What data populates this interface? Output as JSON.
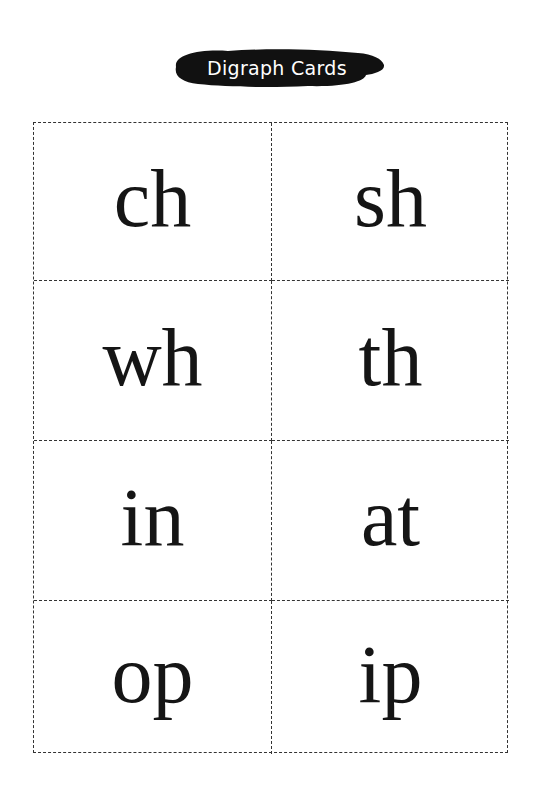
{
  "header": {
    "title": "Digraph Cards"
  },
  "cards": [
    {
      "text": "ch"
    },
    {
      "text": "sh"
    },
    {
      "text": "wh"
    },
    {
      "text": "th"
    },
    {
      "text": "in"
    },
    {
      "text": "at"
    },
    {
      "text": "op"
    },
    {
      "text": "ip"
    }
  ],
  "colors": {
    "banner": "#111111",
    "banner_text": "#ffffff",
    "border": "#333333"
  }
}
